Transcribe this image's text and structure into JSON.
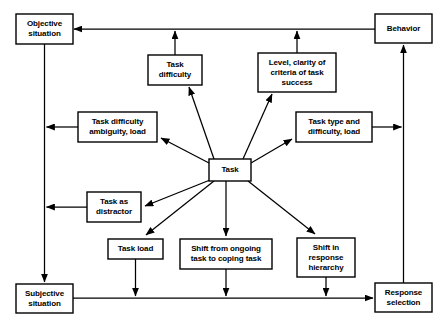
{
  "diagram": {
    "style": {
      "background": "#ffffff",
      "line_color": "#000000",
      "box_fill": "#ffffff",
      "text_color": "#000000"
    },
    "nodes": [
      {
        "id": "objective-situation",
        "lines": [
          "Objective",
          "situation"
        ],
        "x": 16,
        "y": 14,
        "w": 57,
        "h": 30
      },
      {
        "id": "behavior",
        "lines": [
          "Behavior"
        ],
        "x": 375,
        "y": 14,
        "w": 57,
        "h": 29
      },
      {
        "id": "task-difficulty",
        "lines": [
          "Task",
          "difficulty"
        ],
        "x": 148,
        "y": 55,
        "w": 54,
        "h": 30
      },
      {
        "id": "level-clarity-criteria",
        "lines": [
          "Level, clarity of",
          "criteria of task",
          "success"
        ],
        "x": 258,
        "y": 53,
        "w": 78,
        "h": 39
      },
      {
        "id": "task-difficulty-ambiguity-load",
        "lines": [
          "Task difficulty",
          "ambiguity, load"
        ],
        "x": 78,
        "y": 112,
        "w": 79,
        "h": 30
      },
      {
        "id": "task-type-difficulty-load",
        "lines": [
          "Task type and",
          "difficulty, load"
        ],
        "x": 296,
        "y": 112,
        "w": 76,
        "h": 30
      },
      {
        "id": "task",
        "lines": [
          "Task"
        ],
        "x": 209,
        "y": 159,
        "w": 42,
        "h": 22
      },
      {
        "id": "task-as-distractor",
        "lines": [
          "Task as",
          "distractor"
        ],
        "x": 87,
        "y": 192,
        "w": 54,
        "h": 30
      },
      {
        "id": "task-load",
        "lines": [
          "Task load"
        ],
        "x": 108,
        "y": 239,
        "w": 55,
        "h": 20
      },
      {
        "id": "shift-from-ongoing-task",
        "lines": [
          "Shift from ongoing",
          "task to coping task"
        ],
        "x": 180,
        "y": 239,
        "w": 92,
        "h": 30
      },
      {
        "id": "shift-in-response-hierarchy",
        "lines": [
          "Shift in",
          "response",
          "hierarchy"
        ],
        "x": 297,
        "y": 238,
        "w": 58,
        "h": 39
      },
      {
        "id": "subjective-situation",
        "lines": [
          "Subjective",
          "situation"
        ],
        "x": 16,
        "y": 284,
        "w": 57,
        "h": 29
      },
      {
        "id": "response-selection",
        "lines": [
          "Response",
          "selection"
        ],
        "x": 375,
        "y": 283,
        "w": 57,
        "h": 29
      }
    ],
    "edges": [
      {
        "id": "behavior-to-objective-situation",
        "from": "behavior",
        "to": "objective-situation",
        "kind": "orthogonal-top"
      },
      {
        "id": "objective-situation-to-subjective-situation",
        "from": "objective-situation",
        "to": "subjective-situation",
        "kind": "vertical-left"
      },
      {
        "id": "subjective-situation-to-response-selection",
        "from": "subjective-situation",
        "to": "response-selection",
        "kind": "orthogonal-bottom"
      },
      {
        "id": "response-selection-to-behavior",
        "from": "response-selection",
        "to": "behavior",
        "kind": "vertical-right"
      },
      {
        "id": "task-difficulty-to-top-line",
        "from": "task-difficulty",
        "to": "objective-situation",
        "kind": "up"
      },
      {
        "id": "level-clarity-to-top-line",
        "from": "level-clarity-criteria",
        "to": "objective-situation",
        "kind": "up"
      },
      {
        "id": "task-difficulty-ambiguity-to-left-line",
        "from": "task-difficulty-ambiguity-load",
        "to": "objective-situation",
        "kind": "left"
      },
      {
        "id": "task-as-distractor-to-left-line",
        "from": "task-as-distractor",
        "to": "subjective-situation",
        "kind": "left"
      },
      {
        "id": "task-type-difficulty-to-behavior-line",
        "from": "task-type-difficulty-load",
        "to": "behavior",
        "kind": "right"
      },
      {
        "id": "task-load-to-bottom-line",
        "from": "task-load",
        "to": "subjective-situation",
        "kind": "down"
      },
      {
        "id": "shift-from-ongoing-task-to-bottom-line",
        "from": "shift-from-ongoing-task",
        "to": "response-selection",
        "kind": "down"
      },
      {
        "id": "shift-in-response-hierarchy-to-bottom-line",
        "from": "shift-in-response-hierarchy",
        "to": "response-selection",
        "kind": "down"
      },
      {
        "id": "task-to-task-difficulty",
        "from": "task",
        "to": "task-difficulty",
        "kind": "diagonal"
      },
      {
        "id": "task-to-level-clarity",
        "from": "task",
        "to": "level-clarity-criteria",
        "kind": "diagonal"
      },
      {
        "id": "task-to-task-difficulty-ambiguity",
        "from": "task",
        "to": "task-difficulty-ambiguity-load",
        "kind": "diagonal"
      },
      {
        "id": "task-to-task-type-difficulty",
        "from": "task",
        "to": "task-type-difficulty-load",
        "kind": "diagonal"
      },
      {
        "id": "task-to-task-as-distractor",
        "from": "task",
        "to": "task-as-distractor",
        "kind": "diagonal"
      },
      {
        "id": "task-to-task-load",
        "from": "task",
        "to": "task-load",
        "kind": "diagonal"
      },
      {
        "id": "task-to-shift-from-ongoing-task",
        "from": "task",
        "to": "shift-from-ongoing-task",
        "kind": "down"
      },
      {
        "id": "task-to-shift-in-response-hierarchy",
        "from": "task",
        "to": "shift-in-response-hierarchy",
        "kind": "diagonal"
      }
    ]
  }
}
